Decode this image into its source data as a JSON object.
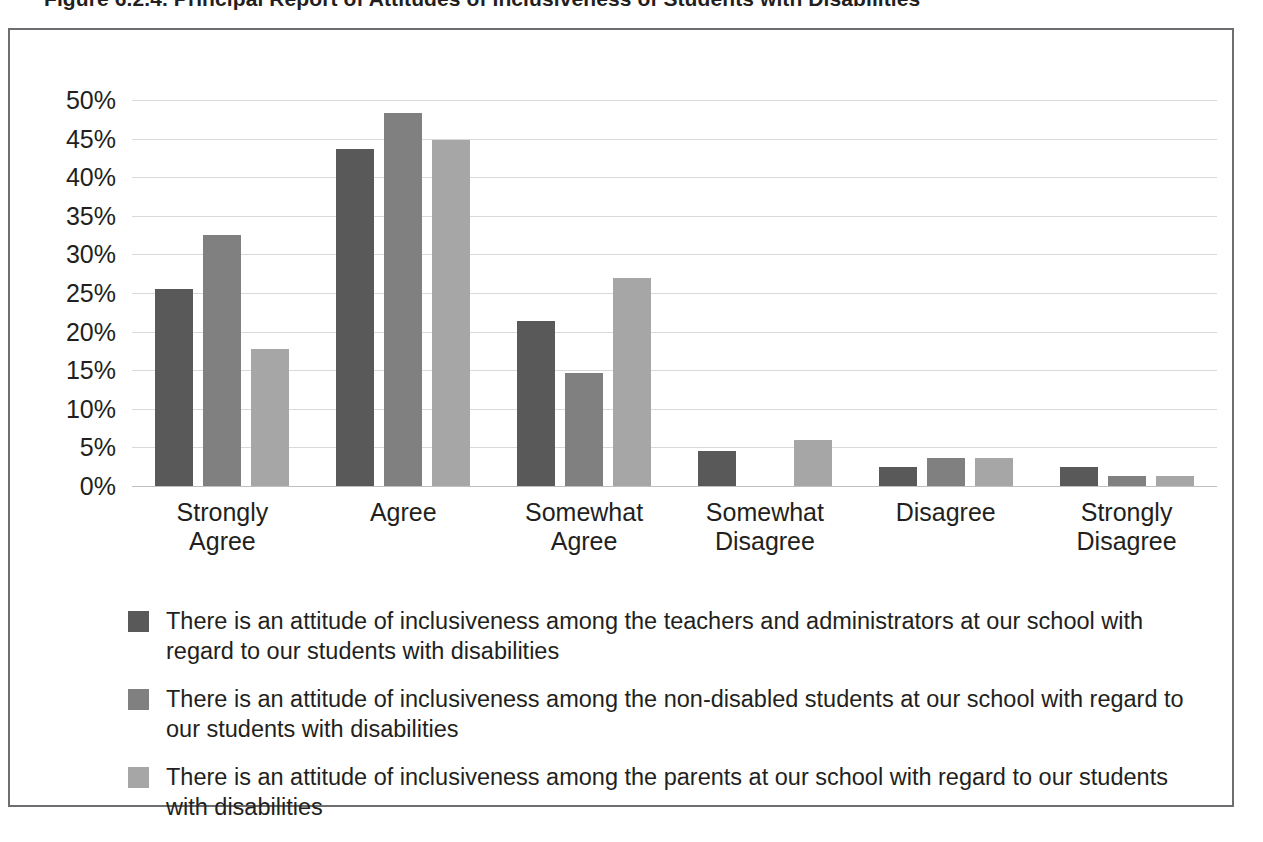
{
  "figure": {
    "title": "Figure 6.2.4. Principal Report of Attitudes of Inclusiveness of Students with Disabilities"
  },
  "colors": {
    "series_dark": "#595959",
    "series_medium": "#808080",
    "series_light": "#a6a6a6",
    "gridline": "#d9d9d9",
    "frame": "#6d6e71",
    "text": "#231f20"
  },
  "chart_data": {
    "type": "bar",
    "title": "Figure 6.2.4. Principal Report of Attitudes of Inclusiveness of Students with Disabilities",
    "xlabel": "",
    "ylabel": "",
    "ylim": [
      0,
      50
    ],
    "grid": true,
    "legend_position": "bottom",
    "ytick_labels": [
      "50%",
      "45%",
      "40%",
      "35%",
      "30%",
      "25%",
      "20%",
      "15%",
      "10%",
      "5%",
      "0%"
    ],
    "ytick_values": [
      50,
      45,
      40,
      35,
      30,
      25,
      20,
      15,
      10,
      5,
      0
    ],
    "categories": [
      "Strongly Agree",
      "Agree",
      "Somewhat Agree",
      "Somewhat Disagree",
      "Disagree",
      "Strongly Disagree"
    ],
    "category_lines": [
      [
        "Strongly",
        "Agree"
      ],
      [
        "Agree",
        ""
      ],
      [
        "Somewhat",
        "Agree"
      ],
      [
        "Somewhat",
        "Disagree"
      ],
      [
        "Disagree",
        ""
      ],
      [
        "Strongly",
        "Disagree"
      ]
    ],
    "series": [
      {
        "name": "There is an attitude of inclusiveness among the teachers and administrators at our school with regard to our students with disabilities",
        "color": "#595959",
        "values": [
          25.5,
          43.7,
          21.4,
          4.5,
          2.4,
          2.4
        ]
      },
      {
        "name": "There is an attitude of inclusiveness among the non-disabled students at our school with regard to our students with disabilities",
        "color": "#808080",
        "values": [
          32.5,
          48.3,
          14.6,
          0,
          3.6,
          1.3
        ]
      },
      {
        "name": "There is an attitude of inclusiveness among the parents at our school with regard to our students with disabilities",
        "color": "#a6a6a6",
        "values": [
          17.8,
          44.8,
          27.0,
          5.9,
          3.6,
          1.3
        ]
      }
    ]
  },
  "legend": {
    "items": [
      {
        "swatch": "s0",
        "label": "There is an attitude of inclusiveness among the teachers and administrators at our school with regard to our students with disabilities"
      },
      {
        "swatch": "s1",
        "label": "There is an attitude of inclusiveness among the non-disabled students at our school with regard to our students with disabilities"
      },
      {
        "swatch": "s2",
        "label": "There is an attitude of inclusiveness among the parents at our school with regard to our students with disabilities"
      }
    ]
  }
}
